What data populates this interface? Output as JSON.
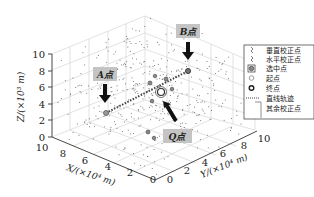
{
  "chart_data": {
    "type": "scatter3d",
    "title": "",
    "xlabel": "X/(×10⁴ m)",
    "ylabel": "Y/(×10⁴ m)",
    "zlabel": "Z/(×10³ m)",
    "xlim": [
      0,
      10
    ],
    "ylim": [
      0,
      10
    ],
    "zlim": [
      0,
      10
    ],
    "x_ticks": [
      "0",
      "2",
      "4",
      "6",
      "8",
      "10"
    ],
    "y_ticks": [
      "0",
      "2",
      "4",
      "6",
      "8",
      "10"
    ],
    "z_ticks": [
      "0",
      "2",
      "4",
      "6",
      "8",
      "10"
    ],
    "grid": true,
    "legend_position": "right",
    "legend": [
      {
        "label": "垂直校正点",
        "marker": "vertical-correction-point"
      },
      {
        "label": "水平校正点",
        "marker": "horizontal-correction-point"
      },
      {
        "label": "选中点",
        "marker": "selected-point"
      },
      {
        "label": "起点",
        "marker": "start-point"
      },
      {
        "label": "终点",
        "marker": "end-point"
      },
      {
        "label": "直线轨迹",
        "marker": "dotted-line"
      },
      {
        "label": "其余校正点",
        "marker": "other-correction-points"
      }
    ],
    "annotations": [
      {
        "label": "A点",
        "role": "start point",
        "x": 0,
        "y": 5,
        "z": 5
      },
      {
        "label": "B点",
        "role": "end point",
        "x": 10,
        "y": 5,
        "z": 5
      },
      {
        "label": "Q点",
        "role": "selected point",
        "x": 5,
        "y": 5,
        "z": 5
      }
    ],
    "series": [
      {
        "name": "直线轨迹",
        "type": "line",
        "style": "dotted",
        "points": [
          [
            0,
            5,
            5
          ],
          [
            10,
            5,
            5
          ]
        ]
      }
    ]
  },
  "axes": {
    "z_label": "Z/(×10³ m)",
    "x_label": "X/(×10⁴ m)",
    "y_label": "Y/(×10⁴ m)",
    "z_ticks": [
      "10",
      "8",
      "6",
      "4",
      "2",
      "0"
    ],
    "x_ticks": [
      "10",
      "8",
      "6",
      "4",
      "2",
      "0"
    ],
    "y_ticks": [
      "0",
      "2",
      "4",
      "6",
      "8",
      "10"
    ]
  },
  "callouts": {
    "a": "A点",
    "b": "B点",
    "q": "Q点"
  },
  "legend": {
    "items": [
      "垂直校正点",
      "水平校正点",
      "选中点",
      "起点",
      "终点",
      "直线轨迹",
      "其余校正点"
    ]
  },
  "colors": {
    "axis": "#333333",
    "grid": "#cccccc",
    "callout_bg": "#c4c4c4",
    "arrow": "#111111",
    "point": "#555555"
  }
}
